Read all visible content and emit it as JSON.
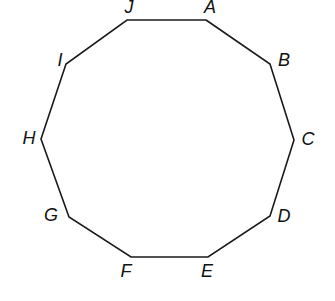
{
  "diagram": {
    "type": "regular-polygon",
    "shape": "decagon",
    "stroke_color": "#1a1a1a",
    "label_color": "#111111",
    "vertices": [
      {
        "label": "A",
        "x": 206,
        "y": 20,
        "lx": 210,
        "ly": 8
      },
      {
        "label": "B",
        "x": 270,
        "y": 64,
        "lx": 284,
        "ly": 61
      },
      {
        "label": "C",
        "x": 294,
        "y": 140,
        "lx": 308,
        "ly": 140
      },
      {
        "label": "D",
        "x": 270,
        "y": 216,
        "lx": 284,
        "ly": 217
      },
      {
        "label": "E",
        "x": 208,
        "y": 257,
        "lx": 207,
        "ly": 272
      },
      {
        "label": "F",
        "x": 131,
        "y": 257,
        "lx": 126,
        "ly": 272
      },
      {
        "label": "G",
        "x": 69,
        "y": 217,
        "lx": 51,
        "ly": 216
      },
      {
        "label": "H",
        "x": 41,
        "y": 139,
        "lx": 29,
        "ly": 139
      },
      {
        "label": "I",
        "x": 66,
        "y": 64,
        "lx": 60,
        "ly": 61
      },
      {
        "label": "J",
        "x": 127,
        "y": 20,
        "lx": 129,
        "ly": 8
      }
    ]
  }
}
